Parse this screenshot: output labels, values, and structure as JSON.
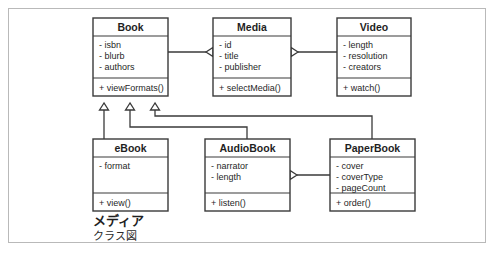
{
  "diagram": {
    "kind": "uml-class-diagram",
    "caption": {
      "line1": "メディア",
      "line2": "クラス図"
    },
    "colors": {
      "stroke": "#3a3a3a",
      "box_fill": "#ffffff",
      "text": "#1f1f1f",
      "frame": "#b9b9b9",
      "background": "#ffffff"
    },
    "classes": [
      {
        "id": "book",
        "name": "Book",
        "attributes": [
          "- isbn",
          "- blurb",
          "- authors"
        ],
        "operations": [
          "+ viewFormats()"
        ],
        "box": {
          "x": 93,
          "y": 18,
          "w": 75,
          "h": 78
        },
        "title_h": 18,
        "attr_h": 42
      },
      {
        "id": "media",
        "name": "Media",
        "attributes": [
          "- id",
          "- title",
          "- publisher"
        ],
        "operations": [
          "+ selectMedia()"
        ],
        "box": {
          "x": 213,
          "y": 18,
          "w": 78,
          "h": 78
        },
        "title_h": 18,
        "attr_h": 42
      },
      {
        "id": "video",
        "name": "Video",
        "attributes": [
          "- length",
          "- resolution",
          "- creators"
        ],
        "operations": [
          "+ watch()"
        ],
        "box": {
          "x": 337,
          "y": 18,
          "w": 74,
          "h": 78
        },
        "title_h": 18,
        "attr_h": 42
      },
      {
        "id": "ebook",
        "name": "eBook",
        "attributes": [
          "- format"
        ],
        "operations": [
          "+ view()"
        ],
        "box": {
          "x": 93,
          "y": 139,
          "w": 75,
          "h": 72
        },
        "title_h": 18,
        "attr_h": 36
      },
      {
        "id": "audiobook",
        "name": "AudioBook",
        "attributes": [
          "- narrator",
          "- length"
        ],
        "operations": [
          "+ listen()"
        ],
        "box": {
          "x": 205,
          "y": 139,
          "w": 85,
          "h": 72
        },
        "title_h": 18,
        "attr_h": 36
      },
      {
        "id": "paperbook",
        "name": "PaperBook",
        "attributes": [
          "- cover",
          "- coverType",
          "- pageCount"
        ],
        "operations": [
          "+ order()"
        ],
        "box": {
          "x": 330,
          "y": 139,
          "w": 85,
          "h": 72
        },
        "title_h": 18,
        "attr_h": 36
      }
    ],
    "relations": [
      {
        "id": "book-to-media",
        "type": "generalization",
        "from": "book",
        "to": "media",
        "label": "Book inherits Media",
        "path": "M 168 52 L 206 52",
        "arrow": "M 206 52 L 213 47.5 L 213 56.5 Z"
      },
      {
        "id": "video-to-media",
        "type": "generalization",
        "from": "video",
        "to": "media",
        "label": "Video inherits Media",
        "path": "M 337 52 L 298 52",
        "arrow": "M 298 52 L 291 47.5 L 291 56.5 Z"
      },
      {
        "id": "ebook-to-book",
        "type": "generalization",
        "from": "ebook",
        "to": "book",
        "label": "eBook inherits Book",
        "path": "M 104 139 L 104 103",
        "arrow": "M 104 103 L 99.5 110 L 108.5 110 Z"
      },
      {
        "id": "audiobook-to-book",
        "type": "generalization",
        "from": "audiobook",
        "to": "book",
        "label": "AudioBook inherits Book",
        "path": "M 247 139 L 247 127 L 130 127 L 130 103",
        "arrow": "M 130 103 L 125.5 110 L 134.5 110 Z"
      },
      {
        "id": "paperbook-to-book",
        "type": "generalization",
        "from": "paperbook",
        "to": "book",
        "label": "PaperBook inherits Book",
        "path": "M 372 139 L 372 116 L 155 116 L 155 103",
        "arrow": "M 155 103 L 150.5 110 L 159.5 110 Z"
      },
      {
        "id": "paperbook-to-audiobook",
        "type": "generalization",
        "from": "paperbook",
        "to": "audiobook",
        "label": "PaperBook relates to AudioBook",
        "path": "M 330 175 L 297 175",
        "arrow": "M 297 175 L 290 170.5 L 290 179.5 Z"
      }
    ],
    "caption_pos": {
      "x": 93,
      "y": 225
    }
  }
}
